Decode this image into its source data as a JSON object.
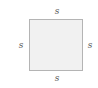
{
  "diagram": {
    "shape": "square",
    "colors": {
      "fill": "#f1f1f1",
      "border": "#b4b4b4",
      "label": "#555555"
    },
    "labels": {
      "top": "s",
      "bottom": "s",
      "left": "s",
      "right": "s"
    }
  }
}
